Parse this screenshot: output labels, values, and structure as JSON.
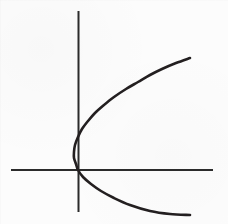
{
  "figure": {
    "title": "",
    "background_color": "#fcfcfc",
    "width": 228,
    "height": 224
  },
  "chart_data": {
    "type": "line",
    "title": "",
    "subtitle": "",
    "xlabel": "",
    "ylabel": "",
    "grid": false,
    "legend": null,
    "axes": {
      "x_axis": {
        "label": "",
        "color": "#2b2b2b",
        "stroke_width": 2,
        "tick_labels": [],
        "pixel_y": 170,
        "pixel_x_start": 11,
        "pixel_x_end": 213
      },
      "y_axis": {
        "label": "",
        "color": "#2b2b2b",
        "stroke_width": 2,
        "tick_labels": [],
        "pixel_x": 78,
        "pixel_y_start": 11,
        "pixel_y_end": 212
      },
      "origin_pixel": [
        78,
        170
      ],
      "xlim": [
        -0.45,
        4.4
      ],
      "ylim": [
        -2.4,
        3.5
      ]
    },
    "series": [
      {
        "name": "parabola",
        "equation": "x = a * y^2  (opens right)",
        "color": "#231f20",
        "stroke_width": 2.6,
        "vertex_pixel": [
          64,
          138
        ],
        "points_pixel": [
          [
            190,
            58
          ],
          [
            176,
            63
          ],
          [
            162,
            69
          ],
          [
            150,
            75
          ],
          [
            138,
            82
          ],
          [
            126,
            89
          ],
          [
            114,
            97
          ],
          [
            104,
            105
          ],
          [
            95,
            113
          ],
          [
            88,
            121
          ],
          [
            82,
            129
          ],
          [
            78,
            137
          ],
          [
            75,
            145
          ],
          [
            74,
            152
          ],
          [
            74,
            158
          ],
          [
            76,
            164
          ],
          [
            78,
            170
          ],
          [
            83,
            177
          ],
          [
            91,
            184
          ],
          [
            101,
            191
          ],
          [
            114,
            198
          ],
          [
            130,
            205
          ],
          [
            150,
            211
          ],
          [
            170,
            214
          ],
          [
            190,
            215
          ]
        ]
      }
    ]
  }
}
